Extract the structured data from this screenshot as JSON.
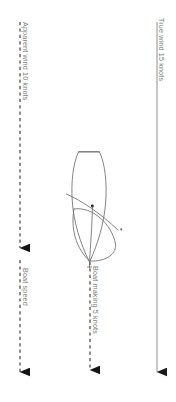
{
  "diagram": {
    "background_color": "#ffffff",
    "line_color": "#6b6b6b",
    "arrow_color": "#111111",
    "text_color": "#8a8a8a",
    "labels": {
      "true_wind": "True wind 15 knots",
      "apparent_wind": "Apparent wind 10 knots",
      "boat_speed": "Boat speed",
      "boat_making": "Boat making 5 knots"
    },
    "vectors": [
      {
        "name": "true-wind-vector",
        "label": "True wind 15 knots",
        "magnitude": 15,
        "unit": "knots",
        "style": "solid",
        "direction": "down",
        "x": 157,
        "y_start": 22,
        "y_end": 382
      },
      {
        "name": "apparent-wind-vector",
        "label": "Apparent wind 10 knots",
        "magnitude": 10,
        "unit": "knots",
        "style": "dashed",
        "direction": "down",
        "x": 20,
        "y_start": 22,
        "y_end": 382,
        "arrowheads": [
          258,
          382
        ]
      },
      {
        "name": "boat-speed-vector",
        "label": "Boat speed",
        "style": "dashed",
        "direction": "down",
        "x": 20,
        "y_start": 258,
        "y_end": 382
      },
      {
        "name": "boat-making-vector",
        "label": "Boat making 5 knots",
        "magnitude": 5,
        "unit": "knots",
        "style": "dashed",
        "direction": "down",
        "x": 90,
        "y_start": 265,
        "y_end": 382
      }
    ],
    "boat": {
      "name": "boat-sketch",
      "description": "hull outline with sail and boom, drawn heeled",
      "hull_center_x": 92,
      "hull_center_y": 196
    }
  }
}
